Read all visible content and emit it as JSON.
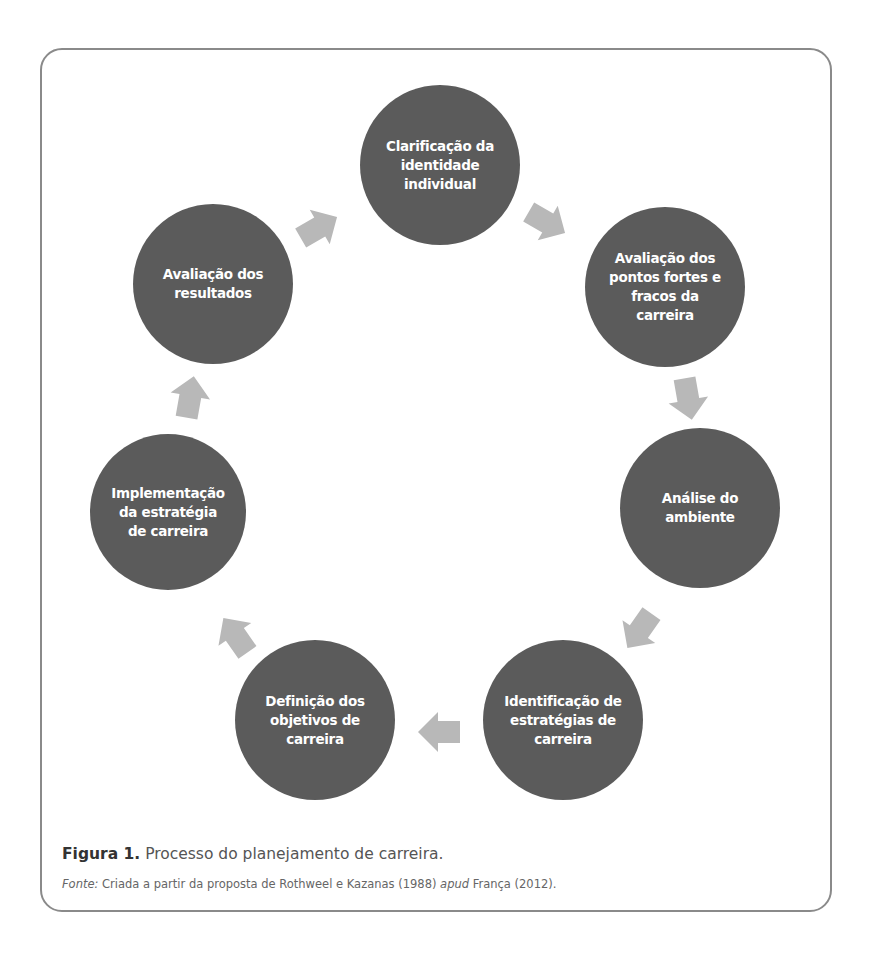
{
  "figure": {
    "nodes": [
      {
        "id": "n1",
        "label": "Clarificação da\nidentidade\nindividual",
        "cx": 440,
        "cy": 165,
        "r": 80
      },
      {
        "id": "n2",
        "label": "Avaliação dos\npontos fortes e\nfracos da\ncarreira",
        "cx": 665,
        "cy": 287,
        "r": 80
      },
      {
        "id": "n3",
        "label": "Análise do\nambiente",
        "cx": 700,
        "cy": 508,
        "r": 80
      },
      {
        "id": "n4",
        "label": "Identificação de\nestratégias de\ncarreira",
        "cx": 563,
        "cy": 720,
        "r": 80
      },
      {
        "id": "n5",
        "label": "Definição dos\nobjetivos de\ncarreira",
        "cx": 315,
        "cy": 720,
        "r": 80
      },
      {
        "id": "n6",
        "label": "Implementação\nda estratégia\nde carreira",
        "cx": 168,
        "cy": 512,
        "r": 78
      },
      {
        "id": "n7",
        "label": "Avaliação dos\nresultados",
        "cx": 213,
        "cy": 284,
        "r": 80
      }
    ],
    "arrows": [
      {
        "from": "n7",
        "to": "n1",
        "cx": 318,
        "cy": 228,
        "rotation": -30
      },
      {
        "from": "n1",
        "to": "n2",
        "cx": 546,
        "cy": 222,
        "rotation": 30
      },
      {
        "from": "n2",
        "to": "n3",
        "cx": 688,
        "cy": 398,
        "rotation": 80
      },
      {
        "from": "n3",
        "to": "n4",
        "cx": 640,
        "cy": 630,
        "rotation": 125
      },
      {
        "from": "n4",
        "to": "n5",
        "cx": 440,
        "cy": 732,
        "rotation": 180
      },
      {
        "from": "n5",
        "to": "n6",
        "cx": 236,
        "cy": 636,
        "rotation": -125
      },
      {
        "from": "n6",
        "to": "n7",
        "cx": 190,
        "cy": 398,
        "rotation": -80
      }
    ],
    "colors": {
      "node": "#5b5b5b",
      "arrow": "#b8b8b8",
      "border": "#8a8a8a",
      "node_text": "#ffffff"
    },
    "caption": {
      "label": "Figura 1.",
      "text": " Processo do planejamento de carreira."
    },
    "source": {
      "label": "Fonte:",
      "text_before": " Criada a partir da proposta de Rothweel e Kazanas (1988) ",
      "italic": "apud",
      "text_after": " França (2012)."
    }
  }
}
